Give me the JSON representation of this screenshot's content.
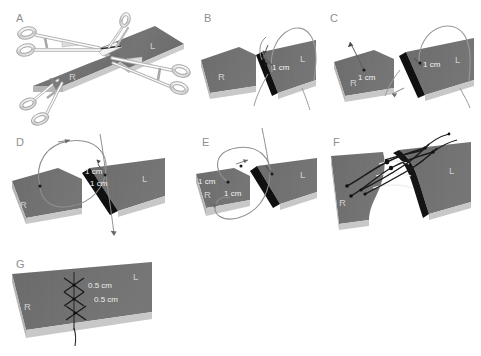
{
  "figure": {
    "background_color": "#ffffff",
    "tissue_color": "#6e6e6e",
    "tissue_top_color": "#7b7b7b",
    "tissue_side_color": "#bdbdbd",
    "cut_edge_color": "#111111",
    "suture_color": "#1a1a1a",
    "thread_color": "#8a8a8a",
    "instrument_color": "#d5d5d5",
    "instrument_stroke": "#9a9a9a",
    "label_color": "#8e8e8e"
  },
  "panels": [
    {
      "id": "A",
      "letter": "A",
      "caption_labels": {
        "right": "R",
        "left": "L"
      },
      "dimensions": [],
      "instruments": [
        "hemostat-forceps",
        "hemostat-forceps"
      ],
      "description": "Two tissue blocks R and L held by opposing hemostat clamps at the coaptation site"
    },
    {
      "id": "B",
      "letter": "B",
      "caption_labels": {
        "right": "R",
        "left": "L"
      },
      "dimensions": [
        "1 cm"
      ],
      "instruments": [
        "curved-needle",
        "suture-thread"
      ],
      "description": "Needle passes through L block 1 cm from the cut edge"
    },
    {
      "id": "C",
      "letter": "C",
      "caption_labels": {
        "right": "R",
        "left": "L"
      },
      "dimensions": [
        "1 cm",
        "1 cm"
      ],
      "instruments": [
        "curved-needle",
        "suture-thread"
      ],
      "description": "Needle exits R block 1 cm from edge and re-enters L block 1 cm from edge"
    },
    {
      "id": "D",
      "letter": "D",
      "caption_labels": {
        "right": "R",
        "left": "L"
      },
      "dimensions": [
        "1 cm",
        "1 cm"
      ],
      "instruments": [
        "curved-needle",
        "suture-thread"
      ],
      "description": "Suture loop drawn across the gap between R and L, 1 cm bites on each side"
    },
    {
      "id": "E",
      "letter": "E",
      "caption_labels": {
        "right": "R",
        "left": "L"
      },
      "dimensions": [
        "1 cm",
        "1 cm"
      ],
      "instruments": [
        "curved-needle",
        "suture-thread"
      ],
      "description": "Second pass completes the loop with 1 cm bites measured on the R block"
    },
    {
      "id": "F",
      "letter": "F",
      "caption_labels": {
        "right": "R",
        "left": "L"
      },
      "dimensions": [],
      "instruments": [
        "suture-thread",
        "suture-knot"
      ],
      "description": "Sutures tied, approximating R and L blocks with ladder of loops across the gap"
    },
    {
      "id": "G",
      "letter": "G",
      "caption_labels": {
        "right": "R",
        "left": "L"
      },
      "dimensions": [
        "0.5 cm",
        "0.5 cm"
      ],
      "instruments": [
        "suture-thread"
      ],
      "description": "Final coapted block with running cross-stitch sutures spaced 0.5 cm apart"
    }
  ]
}
